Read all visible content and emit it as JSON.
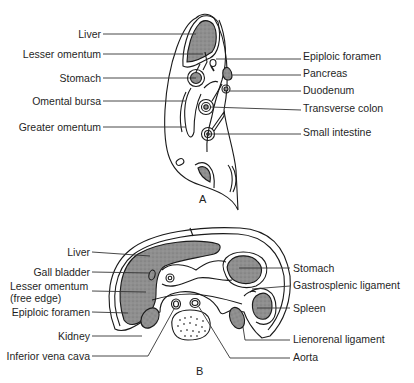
{
  "figure_a": {
    "panel_label": "A",
    "labels_left": [
      "Liver",
      "Lesser omentum",
      "Stomach",
      "Omental bursa",
      "Greater omentum"
    ],
    "labels_right": [
      "Epiploic foramen",
      "Pancreas",
      "Duodenum",
      "Transverse colon",
      "Small intestine"
    ]
  },
  "figure_b": {
    "panel_label": "B",
    "labels_left": [
      "Liver",
      "Gall bladder",
      "Lesser omentum",
      "(free edge)",
      "Epiploic foramen",
      "Kidney",
      "Inferior vena cava"
    ],
    "labels_right": [
      "Stomach",
      "Gastrosplenic ligament",
      "Spleen",
      "Lienorenal ligament",
      "Aorta"
    ]
  },
  "colors": {
    "organ_fill": "#8a8a8a",
    "outline": "#1a1a1a",
    "background": "#ffffff"
  }
}
